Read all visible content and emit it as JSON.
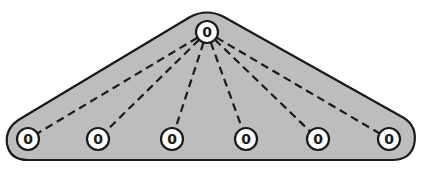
{
  "diagram": {
    "type": "star-tree",
    "colors": {
      "background": "#ffffff",
      "region_fill": "#bdbdbd",
      "outline": "#1a1a1a",
      "node_fill": "#ffffff",
      "edge": "#1a1a1a"
    },
    "root": {
      "id": "root",
      "label": "0",
      "x": 207,
      "y": 32
    },
    "leaves": [
      {
        "id": "leaf-1",
        "label": "0",
        "x": 28,
        "y": 139
      },
      {
        "id": "leaf-2",
        "label": "0",
        "x": 98,
        "y": 139
      },
      {
        "id": "leaf-3",
        "label": "0",
        "x": 172,
        "y": 139
      },
      {
        "id": "leaf-4",
        "label": "0",
        "x": 246,
        "y": 139
      },
      {
        "id": "leaf-5",
        "label": "0",
        "x": 318,
        "y": 139
      },
      {
        "id": "leaf-6",
        "label": "0",
        "x": 389,
        "y": 139
      }
    ],
    "edge_style": "dashed"
  }
}
